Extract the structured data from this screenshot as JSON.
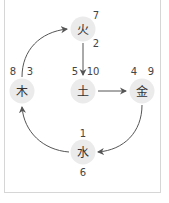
{
  "colors": {
    "node_fill": "#ebebeb",
    "arrow": "#555555",
    "text": "#333333",
    "frame_border": "#d6d6d6"
  },
  "nodes": {
    "fire": {
      "label": "火",
      "cx": 83,
      "cy": 29,
      "numbers": [
        "7",
        "2"
      ]
    },
    "earth": {
      "label": "土",
      "cx": 83,
      "cy": 91,
      "numbers": [
        "5",
        "10"
      ]
    },
    "wood": {
      "label": "木",
      "cx": 22,
      "cy": 91,
      "numbers": [
        "8",
        "3"
      ]
    },
    "metal": {
      "label": "金",
      "cx": 142,
      "cy": 91,
      "numbers": [
        "4",
        "9"
      ]
    },
    "water": {
      "label": "水",
      "cx": 83,
      "cy": 152,
      "numbers": [
        "1",
        "6"
      ]
    }
  },
  "edges": [
    {
      "from": "wood",
      "to": "fire"
    },
    {
      "from": "fire",
      "to": "earth"
    },
    {
      "from": "earth",
      "to": "metal"
    },
    {
      "from": "metal",
      "to": "water"
    },
    {
      "from": "water",
      "to": "wood"
    }
  ]
}
